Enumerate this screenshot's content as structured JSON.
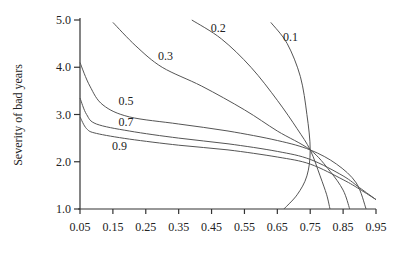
{
  "chart_data": {
    "type": "line",
    "title": "",
    "xlabel": "",
    "ylabel": "Severity of bad years",
    "xlim": [
      0.05,
      0.95
    ],
    "ylim": [
      1.0,
      5.0
    ],
    "x_ticks": [
      "0.05",
      "0.15",
      "0.25",
      "0.35",
      "0.45",
      "0.55",
      "0.65",
      "0.75",
      "0.85",
      "0.95"
    ],
    "y_ticks": [
      "1.0",
      "2.0",
      "3.0",
      "4.0",
      "5.0"
    ],
    "grid": false,
    "legend": "inline curve labels",
    "series": [
      {
        "name": "0.1",
        "points": [
          [
            0.63,
            4.95
          ],
          [
            0.68,
            4.5
          ],
          [
            0.72,
            3.8
          ],
          [
            0.74,
            3.0
          ],
          [
            0.75,
            2.25
          ],
          [
            0.74,
            1.7
          ],
          [
            0.71,
            1.3
          ],
          [
            0.67,
            1.0
          ]
        ]
      },
      {
        "name": "0.2",
        "points": [
          [
            0.39,
            5.0
          ],
          [
            0.48,
            4.6
          ],
          [
            0.57,
            4.0
          ],
          [
            0.65,
            3.3
          ],
          [
            0.71,
            2.7
          ],
          [
            0.75,
            2.25
          ],
          [
            0.78,
            1.7
          ],
          [
            0.8,
            1.3
          ],
          [
            0.81,
            1.0
          ]
        ]
      },
      {
        "name": "0.3",
        "points": [
          [
            0.15,
            4.95
          ],
          [
            0.22,
            4.45
          ],
          [
            0.3,
            4.0
          ],
          [
            0.42,
            3.6
          ],
          [
            0.55,
            3.1
          ],
          [
            0.65,
            2.65
          ],
          [
            0.75,
            2.25
          ],
          [
            0.81,
            1.8
          ],
          [
            0.85,
            1.4
          ],
          [
            0.87,
            1.0
          ]
        ]
      },
      {
        "name": "0.5",
        "points": [
          [
            0.05,
            4.1
          ],
          [
            0.08,
            3.6
          ],
          [
            0.12,
            3.2
          ],
          [
            0.2,
            2.95
          ],
          [
            0.35,
            2.8
          ],
          [
            0.5,
            2.65
          ],
          [
            0.65,
            2.45
          ],
          [
            0.75,
            2.25
          ],
          [
            0.83,
            1.95
          ],
          [
            0.89,
            1.55
          ],
          [
            0.92,
            1.0
          ]
        ]
      },
      {
        "name": "0.7",
        "points": [
          [
            0.05,
            3.35
          ],
          [
            0.07,
            3.0
          ],
          [
            0.1,
            2.8
          ],
          [
            0.2,
            2.65
          ],
          [
            0.35,
            2.5
          ],
          [
            0.5,
            2.38
          ],
          [
            0.65,
            2.22
          ],
          [
            0.75,
            2.05
          ],
          [
            0.85,
            1.7
          ],
          [
            0.9,
            1.45
          ],
          [
            0.95,
            1.2
          ]
        ]
      },
      {
        "name": "0.9",
        "points": [
          [
            0.05,
            2.95
          ],
          [
            0.07,
            2.7
          ],
          [
            0.1,
            2.6
          ],
          [
            0.2,
            2.48
          ],
          [
            0.35,
            2.35
          ],
          [
            0.5,
            2.25
          ],
          [
            0.65,
            2.1
          ],
          [
            0.75,
            1.95
          ],
          [
            0.85,
            1.62
          ],
          [
            0.9,
            1.42
          ],
          [
            0.95,
            1.2
          ]
        ]
      }
    ],
    "annotations": [
      {
        "text": "0.1",
        "x": 0.69,
        "y": 4.55
      },
      {
        "text": "0.2",
        "x": 0.47,
        "y": 4.75
      },
      {
        "text": "0.3",
        "x": 0.31,
        "y": 4.15
      },
      {
        "text": "0.5",
        "x": 0.19,
        "y": 3.2
      },
      {
        "text": "0.7",
        "x": 0.19,
        "y": 2.75
      },
      {
        "text": "0.9",
        "x": 0.17,
        "y": 2.25
      }
    ]
  }
}
